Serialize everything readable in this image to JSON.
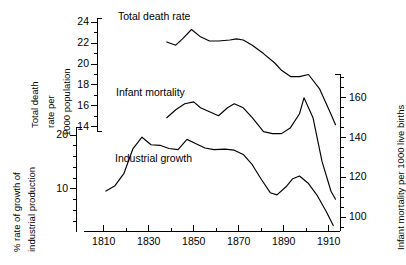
{
  "chart_data": {
    "type": "line",
    "title": "",
    "xlabel": "",
    "xlim": [
      1807,
      1915
    ],
    "xticks": [
      1810,
      1830,
      1850,
      1870,
      1890,
      1910
    ],
    "xtick_labels": [
      "1810",
      "1830",
      "1850",
      "1870",
      "1890",
      "1910"
    ],
    "x_minor_step": 10,
    "grid": false,
    "legend": "inline-labels",
    "axes": [
      {
        "id": "death-rate-axis",
        "position": "left-inner",
        "label": "Total death rate per 1000 population",
        "label_lines": [
          "Total death",
          "rate per",
          "1000 population"
        ],
        "ylim": [
          13.6,
          24.4
        ],
        "yticks": [
          14,
          16,
          18,
          20,
          22,
          24
        ],
        "ytick_labels": [
          "14",
          "16",
          "18",
          "20",
          "22",
          "24"
        ],
        "y_minor_step": 1
      },
      {
        "id": "industrial-growth-axis",
        "position": "left-outer",
        "label": "% rate of growth of industrial production",
        "label_lines": [
          "% rate of growth of",
          "industrial production"
        ],
        "ylim": [
          2,
          21.5
        ],
        "yticks": [
          10,
          20
        ],
        "ytick_labels": [
          "10",
          "20"
        ],
        "y_minor_step": 2
      },
      {
        "id": "infant-mortality-axis",
        "position": "right",
        "label": "Infant mortality per 1000 live births",
        "ylim": [
          93,
          172
        ],
        "yticks": [
          100,
          120,
          140,
          160
        ],
        "ytick_labels": [
          "100",
          "120",
          "140",
          "160"
        ],
        "y_minor_step": 5
      }
    ],
    "series": [
      {
        "name": "Total death rate",
        "axis": "death-rate-axis",
        "unit": "deaths per 1000 population",
        "x": [
          1838,
          1842,
          1845,
          1849,
          1853,
          1857,
          1861,
          1866,
          1869,
          1872,
          1876,
          1881,
          1886,
          1889,
          1893,
          1897,
          1901,
          1906,
          1911,
          1913
        ],
        "y": [
          22.1,
          21.8,
          22.4,
          23.3,
          22.6,
          22.2,
          22.2,
          22.3,
          22.4,
          22.3,
          21.8,
          21.0,
          20.1,
          19.4,
          18.8,
          18.8,
          19.0,
          17.6,
          15.2,
          14.2
        ]
      },
      {
        "name": "Infant mortality",
        "axis": "infant-mortality-axis",
        "unit": "deaths per 1000 live births",
        "x": [
          1838,
          1842,
          1846,
          1850,
          1853,
          1857,
          1861,
          1865,
          1868,
          1872,
          1876,
          1881,
          1885,
          1889,
          1893,
          1897,
          1899,
          1903,
          1907,
          1911,
          1913
        ],
        "y": [
          150,
          154,
          157,
          158,
          155,
          153,
          151,
          155,
          157,
          155,
          150,
          143,
          142,
          142,
          145,
          152,
          160,
          150,
          128,
          113,
          109
        ]
      },
      {
        "name": "Industrial growth",
        "axis": "industrial-growth-axis",
        "unit": "% rate of growth",
        "x": [
          1811,
          1815,
          1819,
          1823,
          1827,
          1831,
          1835,
          1839,
          1843,
          1847,
          1851,
          1855,
          1859,
          1864,
          1868,
          1872,
          1876,
          1880,
          1884,
          1887,
          1891,
          1894,
          1897,
          1901,
          1905,
          1909,
          1912
        ],
        "y": [
          9.6,
          10.6,
          12.9,
          17.5,
          19.6,
          18.2,
          18.1,
          17.5,
          17.3,
          19.2,
          18.4,
          17.6,
          17.3,
          17.4,
          17.2,
          16.4,
          14.5,
          11.8,
          9.3,
          8.9,
          10.4,
          11.9,
          12.4,
          11.0,
          8.7,
          5.7,
          3.2
        ]
      }
    ],
    "series_labels": [
      {
        "text": "Total death rate",
        "x_px": 118,
        "y_px": 10
      },
      {
        "text": "Infant mortality",
        "x_px": 116,
        "y_px": 86
      },
      {
        "text": "Industrial growth",
        "x_px": 115,
        "y_px": 152
      }
    ]
  },
  "colors": {
    "background": "#ffffff",
    "ink": "#000000",
    "curve": "#000000"
  }
}
